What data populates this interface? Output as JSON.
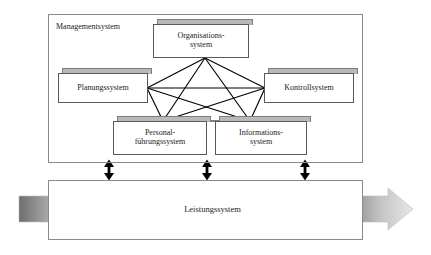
{
  "diagram": {
    "management_frame": {
      "label": "Managementsystem",
      "name": "management-system-frame"
    },
    "performance_frame": {
      "label": "Leistungssystem",
      "name": "performance-system-frame"
    },
    "nodes": [
      {
        "id": "organisationssystem",
        "label": "Organisations-\nsystem"
      },
      {
        "id": "planungssystem",
        "label": "Planungssystem"
      },
      {
        "id": "kontrollsystem",
        "label": "Kontrollsystem"
      },
      {
        "id": "personalfuehrungssystem",
        "label": "Personal-\nführungssystem"
      },
      {
        "id": "informationssystem",
        "label": "Informations-\nsystem"
      }
    ],
    "connectors": {
      "network_label": "Vollvermaschtes Beziehungsnetz der Teilsysteme",
      "vertical_arrows_label": "Wechselwirkung Managementsystem ↔ Leistungssystem",
      "vertical_arrow_count": 3,
      "flow_arrow_left_label": "Input",
      "flow_arrow_right_label": "Output"
    },
    "colors": {
      "frame_border": "#8a8a8d",
      "node_border": "#59595c",
      "node_cap_fill": "#b9b9bb",
      "node_fill": "#ffffff",
      "line": "#000000",
      "arrow_dark": "#6e6e70",
      "arrow_light": "#e3e3e4",
      "cycle_ring": "#c9c9cb",
      "page_background": "#ffffff",
      "text": "#1a1a1a"
    }
  }
}
